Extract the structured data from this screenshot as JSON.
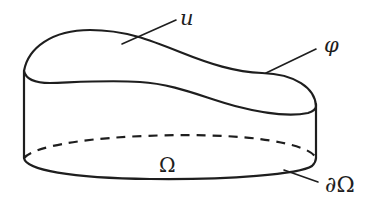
{
  "figure": {
    "labels": {
      "u": "u",
      "phi": "φ",
      "omega": "Ω",
      "boundary": "∂Ω"
    },
    "colors": {
      "ink": "#1e1e1e",
      "background": "#ffffff"
    },
    "elements": [
      {
        "name": "surface-u",
        "label": "u",
        "kind": "graph surface"
      },
      {
        "name": "boundary-curve-phi",
        "label": "φ",
        "kind": "boundary values curve"
      },
      {
        "name": "domain-omega",
        "label": "Ω",
        "kind": "base domain (ellipse)"
      },
      {
        "name": "domain-boundary",
        "label": "∂Ω",
        "kind": "boundary of domain"
      }
    ]
  }
}
